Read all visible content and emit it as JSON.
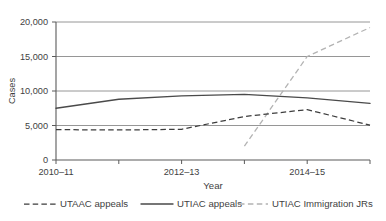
{
  "chart_data": {
    "type": "line",
    "title": "",
    "xlabel": "Year",
    "ylabel": "Cases",
    "ylim": [
      0,
      20000
    ],
    "yticks": [
      0,
      5000,
      10000,
      15000,
      20000
    ],
    "ytick_labels": [
      "0",
      "5,000",
      "10,000",
      "15,000",
      "20,000"
    ],
    "x": [
      "2010-11",
      "2011-12",
      "2012-13",
      "2013-14",
      "2014-15",
      "2015-16"
    ],
    "xtick_labels": [
      "2010–11",
      "2012–13",
      "2014–15"
    ],
    "xtick_label_positions": [
      0,
      2,
      4
    ],
    "grid": "horizontal",
    "legend_position": "bottom",
    "series": [
      {
        "name": "UTAAC appeals",
        "style": "dashed",
        "color": "#3d3d3d",
        "values": [
          4400,
          4350,
          4450,
          6300,
          7300,
          5050
        ]
      },
      {
        "name": "UTIAC appeals",
        "style": "solid",
        "color": "#4a4a4a",
        "values": [
          7500,
          8800,
          9300,
          9500,
          9000,
          8200
        ]
      },
      {
        "name": "UTIAC Immigration JRs",
        "style": "dashed-light",
        "color": "#b3b3b3",
        "values": [
          null,
          null,
          null,
          2000,
          15000,
          19200
        ]
      }
    ]
  },
  "legend": {
    "items": [
      {
        "label": "UTAAC appeals",
        "swatch": "dashed-dark-swatch"
      },
      {
        "label": "UTIAC appeals",
        "swatch": "solid-dark-swatch"
      },
      {
        "label": "UTIAC Immigration JRs",
        "swatch": "dashed-light-swatch"
      }
    ]
  },
  "axes": {
    "y_title": "Cases",
    "x_title": "Year"
  }
}
